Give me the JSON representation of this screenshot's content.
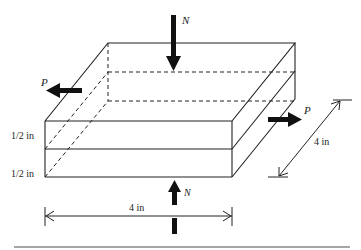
{
  "diagram": {
    "labels": {
      "normal_force_top": "N",
      "normal_force_bottom": "N",
      "shear_force_left": "P",
      "shear_force_right": "P",
      "layer_thickness_top": "1/2 in",
      "layer_thickness_bottom": "1/2 in",
      "width_dimension": "4 in",
      "depth_dimension": "4 in"
    },
    "colors": {
      "line": "#222222",
      "arrow": "#111111",
      "rule": "#888888"
    }
  }
}
